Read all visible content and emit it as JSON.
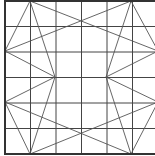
{
  "diagram": {
    "title": "",
    "grid": {
      "cols": 6,
      "rows": 6,
      "x0": 5,
      "y0": 1,
      "cell": 25.5,
      "color": "#444444"
    },
    "border_color": "#333333",
    "diagonal_color": "#555555",
    "points": {
      "T1": [
        30,
        1
      ],
      "T2": [
        131,
        1
      ],
      "L1": [
        5,
        51
      ],
      "L2": [
        5,
        102
      ],
      "B1": [
        30,
        154
      ],
      "B2": [
        131,
        154
      ],
      "R1": [
        158,
        51
      ],
      "R2": [
        158,
        102
      ],
      "M1": [
        55,
        77
      ],
      "M2": [
        106,
        77
      ]
    },
    "segments": [
      [
        "T1",
        "L1"
      ],
      [
        "T1",
        "R1"
      ],
      [
        "T2",
        "L1"
      ],
      [
        "T2",
        "R1"
      ],
      [
        "L1",
        "M1"
      ],
      [
        "M1",
        "L2"
      ],
      [
        "L2",
        "B1"
      ],
      [
        "L2",
        "B2"
      ],
      [
        "B1",
        "R2"
      ],
      [
        "B2",
        "R2"
      ],
      [
        "R1",
        "M2"
      ],
      [
        "M2",
        "R2"
      ],
      [
        "T1",
        "M1"
      ],
      [
        "M1",
        "B1"
      ],
      [
        "T2",
        "M2"
      ],
      [
        "M2",
        "B2"
      ]
    ]
  }
}
